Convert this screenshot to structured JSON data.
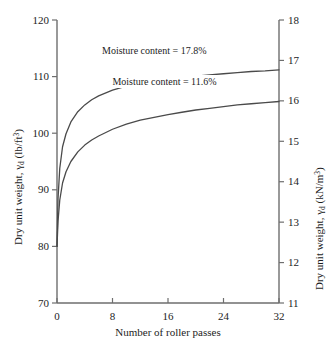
{
  "chart_data": {
    "type": "line",
    "title": "",
    "xlabel": "Number of roller passes",
    "ylabel_left": "Dry unit weight, γd (lb/ft3)",
    "ylabel_right": "Dry unit weight, γd (kN/m3)",
    "xlim": [
      0,
      32
    ],
    "ylim_left": [
      70,
      120
    ],
    "ylim_right": [
      11,
      18
    ],
    "grid": false,
    "legend_position": "inline-annotations",
    "x_ticks": [
      "0",
      "8",
      "16",
      "24",
      "32"
    ],
    "x_tick_values": [
      0,
      8,
      16,
      24,
      32
    ],
    "y_ticks_left": [
      "70",
      "80",
      "90",
      "100",
      "110",
      "120"
    ],
    "y_tick_values_left": [
      70,
      80,
      90,
      100,
      110,
      120
    ],
    "y_ticks_right": [
      "11",
      "12",
      "13",
      "14",
      "15",
      "16",
      "17",
      "18"
    ],
    "y_tick_values_right": [
      11,
      12,
      13,
      14,
      15,
      16,
      17,
      18
    ],
    "line_color": "#4a4a4a",
    "axis_color": "#6e6e6e",
    "series": [
      {
        "name": "Moisture content = 17.8%",
        "label": "Moisture content = 17.8%",
        "x": [
          0,
          0.15,
          0.4,
          0.8,
          1.3,
          2,
          3,
          4,
          5,
          6,
          8,
          10,
          12,
          14,
          16,
          18,
          20,
          22,
          24,
          26,
          28,
          30,
          32
        ],
        "values": [
          80,
          88.5,
          93.8,
          97.6,
          99.9,
          102,
          103.8,
          105,
          105.9,
          106.6,
          107.6,
          108.3,
          108.8,
          109.2,
          109.6,
          109.9,
          110.1,
          110.3,
          110.5,
          110.7,
          110.9,
          111,
          111.2
        ]
      },
      {
        "name": "Moisture content = 11.6%",
        "label": "Moisture content = 11.6%",
        "x": [
          0,
          0.15,
          0.4,
          0.8,
          1.3,
          2,
          3,
          4,
          5,
          6,
          8,
          10,
          12,
          14,
          16,
          18,
          20,
          22,
          24,
          26,
          28,
          30,
          32
        ],
        "values": [
          80,
          84.5,
          88.2,
          91.2,
          93.2,
          95,
          96.7,
          97.9,
          98.8,
          99.5,
          100.7,
          101.6,
          102.3,
          102.8,
          103.3,
          103.7,
          104.1,
          104.4,
          104.7,
          105,
          105.2,
          105.4,
          105.6
        ]
      }
    ],
    "annotations": [
      {
        "text": "Moisture content = 17.8%",
        "x": 16,
        "y": 114.5
      },
      {
        "text": "Moisture content = 11.6%",
        "x": 17.5,
        "y": 109.0
      }
    ]
  }
}
